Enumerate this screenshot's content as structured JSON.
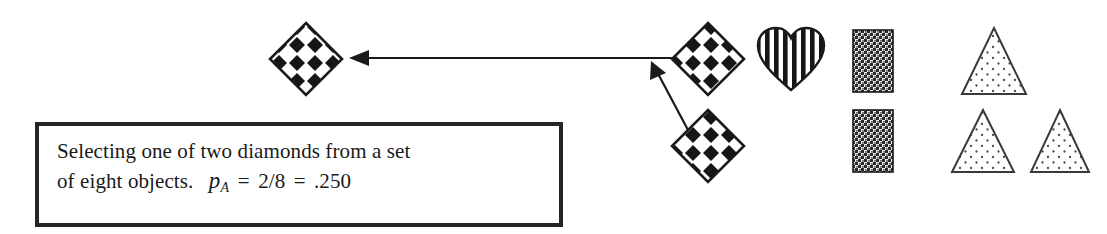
{
  "figure": {
    "title": "Selecting one of two diamonds from a set of eight objects",
    "width": 1107,
    "height": 234,
    "background_color": "#ffffff",
    "ink_color": "#1a1a1a"
  },
  "caption": {
    "line1": "Selecting one of two diamonds from a set",
    "line2_prefix": "of eight objects.",
    "formula": {
      "variable": "p",
      "subscript": "A",
      "equals1": "=",
      "fraction": "2/8",
      "equals2": "=",
      "value": ".250"
    },
    "border_color": "#252525"
  },
  "objects": {
    "total_count": 8,
    "selected_count": 2,
    "selected_shape": "diamond",
    "items": [
      {
        "name": "diamond-selected-target",
        "shape": "diamond",
        "fill": "checkerboard-diamonds",
        "x": 270,
        "y": 23,
        "w": 72,
        "h": 72,
        "role": "result"
      },
      {
        "name": "diamond-source-top",
        "shape": "diamond",
        "fill": "checkerboard-diamonds",
        "x": 672,
        "y": 23,
        "w": 72,
        "h": 72,
        "role": "source"
      },
      {
        "name": "diamond-source-bottom",
        "shape": "diamond",
        "fill": "checkerboard-diamonds",
        "x": 672,
        "y": 110,
        "w": 72,
        "h": 72,
        "role": "source"
      },
      {
        "name": "heart-striped",
        "shape": "heart",
        "fill": "vertical-stripes",
        "x": 758,
        "y": 28,
        "w": 66,
        "h": 62,
        "role": "other"
      },
      {
        "name": "rectangle-hatched-top",
        "shape": "rectangle",
        "fill": "dense-crosshatch",
        "x": 853,
        "y": 30,
        "w": 40,
        "h": 62,
        "role": "other"
      },
      {
        "name": "rectangle-hatched-bottom",
        "shape": "rectangle",
        "fill": "dense-crosshatch",
        "x": 853,
        "y": 110,
        "w": 40,
        "h": 62,
        "role": "other"
      },
      {
        "name": "triangle-dotted-top",
        "shape": "triangle",
        "fill": "dots",
        "x": 962,
        "y": 28,
        "w": 64,
        "h": 66,
        "role": "other"
      },
      {
        "name": "triangle-dotted-bottom-left",
        "shape": "triangle",
        "fill": "dots",
        "x": 952,
        "y": 110,
        "w": 62,
        "h": 62,
        "role": "other"
      },
      {
        "name": "triangle-dotted-bottom-right",
        "shape": "triangle",
        "fill": "dots",
        "x": 1031,
        "y": 110,
        "w": 58,
        "h": 62,
        "role": "other"
      }
    ]
  },
  "arrows": [
    {
      "name": "arrow-horizontal-to-result",
      "from_x": 672,
      "from_y": 58,
      "to_x": 349,
      "to_y": 58,
      "direction": "left"
    },
    {
      "name": "arrow-diagonal-from-lower-diamond",
      "from_x": 686,
      "from_y": 128,
      "to_x": 651,
      "to_y": 63,
      "direction": "up-right"
    }
  ],
  "colors": {
    "ink": "#1a1a1a",
    "pattern_dark": "#161616",
    "pattern_light": "#ffffff",
    "dot": "#4a4a4a",
    "box_border": "#252525"
  }
}
